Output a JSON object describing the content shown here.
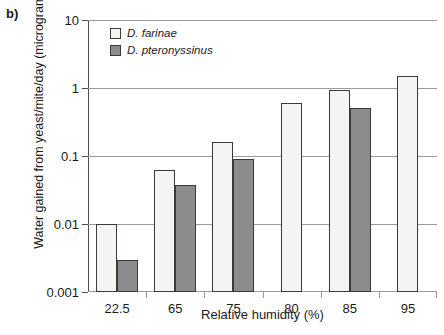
{
  "panel": {
    "label": "b)"
  },
  "legend": {
    "position": "top-left-inside",
    "entries": [
      {
        "label": "D. farinae",
        "color": "#f4f4f2",
        "swatch": "light"
      },
      {
        "label": "D. pteronyssinus",
        "color": "#8c8c8c",
        "swatch": "dark"
      }
    ]
  },
  "chart_data": {
    "type": "bar",
    "title": "",
    "subtitle": "",
    "xlabel": "Relative humidity (%)",
    "ylabel": "Water gained from yeast/mite/day (micrograms)",
    "yscale": "log",
    "ylim": [
      0.001,
      10
    ],
    "yticks": [
      0.001,
      0.01,
      0.1,
      1,
      10
    ],
    "ytick_labels": [
      "0.001",
      "0.01",
      "0.1",
      "1",
      "10"
    ],
    "grid": "horizontal",
    "categories": [
      "22.5",
      "65",
      "75",
      "80",
      "85",
      "95"
    ],
    "series": [
      {
        "name": "D. farinae",
        "color": "#f4f4f2",
        "values": [
          0.01,
          0.062,
          0.16,
          0.6,
          0.95,
          1.5
        ]
      },
      {
        "name": "D. pteronyssinus",
        "color": "#8c8c8c",
        "values": [
          0.003,
          0.037,
          0.09,
          null,
          0.5,
          null
        ]
      }
    ],
    "annotations": []
  }
}
